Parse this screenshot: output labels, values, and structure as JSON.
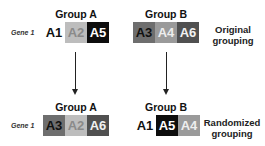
{
  "top": {
    "group_a": {
      "title": "Group A",
      "gene_label": "Gene 1",
      "cells": [
        {
          "label": "A1",
          "bg": "#ffffff",
          "fg": "#111111"
        },
        {
          "label": "A2",
          "bg": "#bdbdbd",
          "fg": "#8a8a8a"
        },
        {
          "label": "A5",
          "bg": "#0d0d0d",
          "fg": "#ffffff"
        }
      ]
    },
    "group_b": {
      "title": "Group B",
      "cells": [
        {
          "label": "A3",
          "bg": "#6e6e6e",
          "fg": "#111111"
        },
        {
          "label": "A4",
          "bg": "#9a9a9a",
          "fg": "#eeeeee"
        },
        {
          "label": "A6",
          "bg": "#505050",
          "fg": "#f2f2f2"
        }
      ]
    },
    "side_label_line1": "Original",
    "side_label_line2": "grouping"
  },
  "bottom": {
    "group_a": {
      "title": "Group A",
      "gene_label": "Gene 1",
      "cells": [
        {
          "label": "A3",
          "bg": "#6e6e6e",
          "fg": "#111111"
        },
        {
          "label": "A2",
          "bg": "#bdbdbd",
          "fg": "#8a8a8a"
        },
        {
          "label": "A6",
          "bg": "#505050",
          "fg": "#f2f2f2"
        }
      ]
    },
    "group_b": {
      "title": "Group B",
      "cells": [
        {
          "label": "A1",
          "bg": "#ffffff",
          "fg": "#111111"
        },
        {
          "label": "A5",
          "bg": "#0d0d0d",
          "fg": "#ffffff"
        },
        {
          "label": "A4",
          "bg": "#9a9a9a",
          "fg": "#eeeeee"
        }
      ]
    },
    "side_label_line1": "Randomized",
    "side_label_line2": "grouping"
  }
}
